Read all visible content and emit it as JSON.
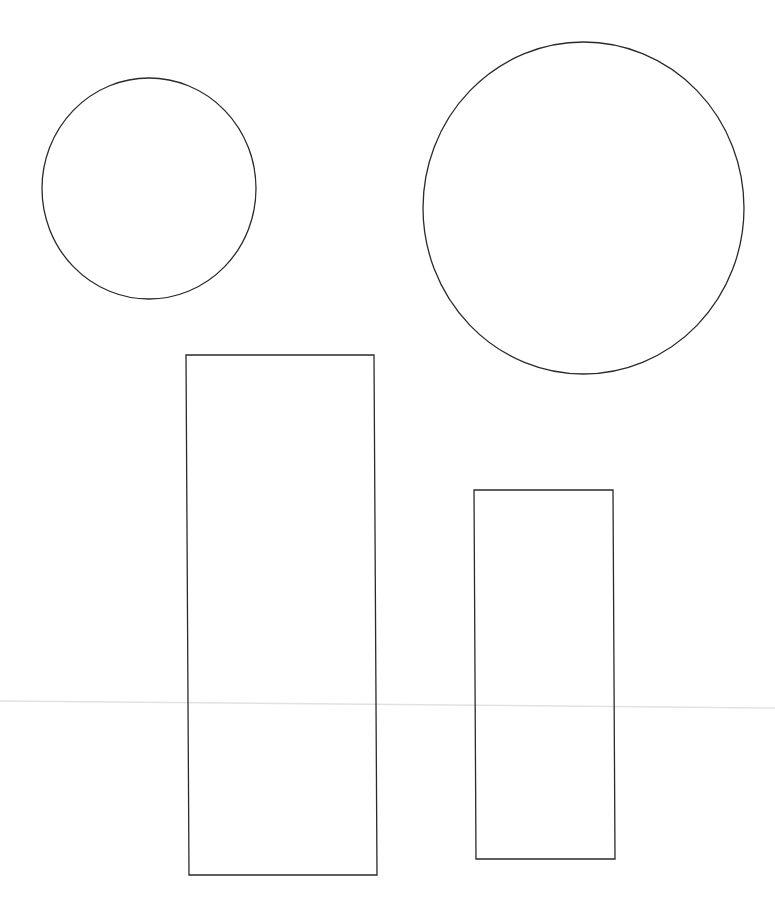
{
  "canvas": {
    "width": 775,
    "height": 917,
    "background": "#ffffff",
    "stroke": "#2a2a2a",
    "stroke_width": 1.3
  },
  "shapes": {
    "circle_small": {
      "type": "ellipse",
      "cx": 149,
      "cy": 188.5,
      "rx": 107,
      "ry": 110.5
    },
    "circle_large": {
      "type": "ellipse",
      "cx": 583.5,
      "cy": 208,
      "rx": 160.5,
      "ry": 166
    },
    "rect_tall": {
      "type": "quad",
      "points": "186,355 374,355 377,875 189,875"
    },
    "rect_short": {
      "type": "quad",
      "points": "474,490 613,490 615,859 476,859"
    },
    "guide_line": {
      "type": "line",
      "x1": 0,
      "y1": 701,
      "x2": 775,
      "y2": 708,
      "color": "#e2e2e2",
      "width": 1.5
    }
  }
}
